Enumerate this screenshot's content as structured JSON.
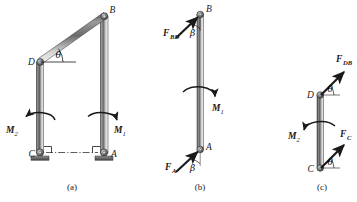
{
  "figure": {
    "background_color": "#ffffff",
    "ink_color": "#1a1a1a",
    "bar_gradient": {
      "dark": "#3a3a3a",
      "mid": "#8f8f8f",
      "light": "#e8e8e8"
    }
  },
  "panels": [
    {
      "id": "a",
      "caption": "(a)",
      "description": "Full frame: inclined bar BD, vertical bars DC and BA, pin supports at C and A, applied moments M1 and M2",
      "points": [
        "B",
        "D",
        "C",
        "A"
      ],
      "angles": [
        "θ"
      ],
      "moments": [
        "M",
        "M"
      ]
    },
    {
      "id": "b",
      "caption": "(b)",
      "description": "Free body of member AB with force F_BD at B, force F_A at A, moment M1",
      "points": [
        "B",
        "A"
      ],
      "angles": [
        "β",
        "β"
      ],
      "forces": [
        "F",
        "F"
      ],
      "moments": [
        "M"
      ]
    },
    {
      "id": "c",
      "caption": "(c)",
      "description": "Free body of member CD with force F_DB at D, force F_C at C, moment M2",
      "points": [
        "D",
        "C"
      ],
      "angles": [
        "θ",
        "θ"
      ],
      "forces": [
        "F",
        "F"
      ],
      "moments": [
        "M"
      ]
    }
  ],
  "labels": {
    "point_B": "B",
    "point_D": "D",
    "point_C": "C",
    "point_A": "A",
    "point_B_b": "B",
    "point_A_b": "A",
    "point_D_c": "D",
    "point_C_c": "C",
    "theta_a": "θ",
    "theta_c_top": "θ",
    "theta_c_bottom": "θ",
    "beta_b_top": "β",
    "beta_b_bottom": "β",
    "moment_M1_a": "M",
    "moment_M1_a_sub": "1",
    "moment_M2_a": "M",
    "moment_M2_a_sub": "2",
    "moment_M1_b": "M",
    "moment_M1_b_sub": "1",
    "moment_M2_c": "M",
    "moment_M2_c_sub": "2",
    "force_FBD": "F",
    "force_FBD_sub": "BD",
    "force_FA": "F",
    "force_FA_sub": "A",
    "force_FDB": "F",
    "force_FDB_sub": "DB",
    "force_FC": "F",
    "force_FC_sub": "C",
    "caption_a": "(a)",
    "caption_b": "(b)",
    "caption_c": "(c)"
  }
}
